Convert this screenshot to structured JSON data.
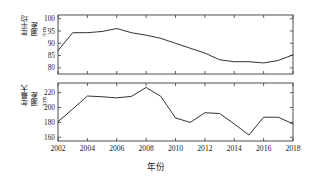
{
  "figure": {
    "xlabel": "年份",
    "top_ylabel_main": "年平均",
    "top_ylabel_sub": "潮差",
    "top_ylabel_unit": "/cm",
    "bottom_ylabel_main": "年最大",
    "bottom_ylabel_sub": "潮差",
    "bottom_ylabel_unit": "/cm",
    "line_color": "#262626",
    "axis_color": "#3a3a3a",
    "background": "#ffffff"
  },
  "chart_data": [
    {
      "type": "line",
      "panel": "top",
      "title": "",
      "xlabel": "",
      "ylabel": "年平均潮差/cm",
      "x": [
        2002,
        2003,
        2004,
        2005,
        2006,
        2007,
        2008,
        2009,
        2010,
        2011,
        2012,
        2013,
        2014,
        2015,
        2016,
        2017,
        2018
      ],
      "values": [
        87.0,
        94.3,
        94.3,
        94.8,
        96.0,
        94.3,
        93.3,
        92.0,
        90.0,
        88.0,
        86.0,
        83.3,
        82.5,
        82.5,
        82.0,
        83.0,
        85.3
      ],
      "xlim": [
        2002,
        2018
      ],
      "ylim": [
        77.5,
        101.5
      ],
      "yticks": [
        80,
        85,
        90,
        95,
        100
      ],
      "ytick_labels": [
        "80",
        "85",
        "90",
        "95",
        "100"
      ],
      "xticks": [
        2002,
        2004,
        2006,
        2008,
        2010,
        2012,
        2014,
        2016,
        2018
      ],
      "xtick_labels": [
        "2002",
        "2004",
        "2006",
        "2008",
        "2010",
        "2012",
        "2014",
        "2016",
        "2018"
      ],
      "xtick_labels_visible": false,
      "grid": false,
      "legend": false
    },
    {
      "type": "line",
      "panel": "bottom",
      "title": "",
      "xlabel": "年份",
      "ylabel": "年最大潮差/cm",
      "x": [
        2002,
        2003,
        2004,
        2005,
        2006,
        2007,
        2008,
        2009,
        2010,
        2011,
        2012,
        2013,
        2014,
        2015,
        2016,
        2017,
        2018
      ],
      "values": [
        181.0,
        198.0,
        215.5,
        214.5,
        213.0,
        215.0,
        227.0,
        215.0,
        186.0,
        180.0,
        193.0,
        192.0,
        178.0,
        163.0,
        187.0,
        187.0,
        178.0
      ],
      "xlim": [
        2002,
        2018
      ],
      "ylim": [
        155.0,
        233.0
      ],
      "yticks": [
        160,
        180,
        200,
        220
      ],
      "ytick_labels": [
        "160",
        "180",
        "200",
        "220"
      ],
      "xticks": [
        2002,
        2004,
        2006,
        2008,
        2010,
        2012,
        2014,
        2016,
        2018
      ],
      "xtick_labels": [
        "2002",
        "2004",
        "2006",
        "2008",
        "2010",
        "2012",
        "2014",
        "2016",
        "2018"
      ],
      "xtick_labels_visible": true,
      "grid": false,
      "legend": false
    }
  ]
}
